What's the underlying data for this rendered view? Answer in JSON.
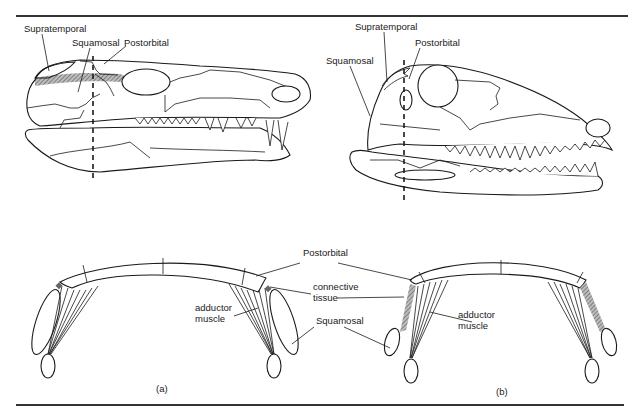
{
  "figure": {
    "top_rule": true,
    "bottom_rule": true,
    "panels": [
      {
        "id": "a",
        "caption": "(a)",
        "skull_labels": {
          "supratemporal": "Supratemporal",
          "squamosal": "Squamosal",
          "postorbital": "Postorbital"
        }
      },
      {
        "id": "b",
        "caption": "(b)",
        "skull_labels": {
          "supratemporal": "Supratemporal",
          "squamosal": "Squamosal",
          "postorbital": "Postorbital"
        }
      }
    ],
    "cross_section_labels": {
      "postorbital": "Postorbital",
      "connective_tissue_line1": "connective",
      "connective_tissue_line2": "tissue",
      "squamosal": "Squamosal",
      "adductor_a_line1": "adductor",
      "adductor_a_line2": "muscle",
      "adductor_b_line1": "adductor",
      "adductor_b_line2": "muscle"
    }
  }
}
